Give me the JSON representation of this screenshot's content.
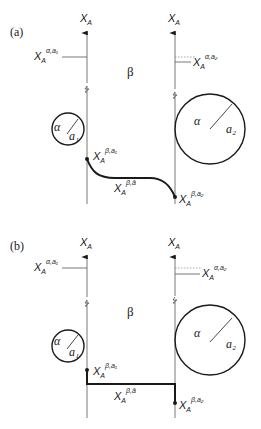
{
  "panels": [
    {
      "id": "a",
      "label": "(a)",
      "left_axis": {
        "label": "X",
        "label_sub": "A",
        "marker": "X",
        "marker_sub": "A",
        "marker_sup": "α,a₁"
      },
      "right_axis": {
        "label": "X",
        "label_sub": "A",
        "marker": "X",
        "marker_sub": "A",
        "marker_sup": "α,a₂"
      },
      "phase_label": "β",
      "small_circle": {
        "phase": "α",
        "radius_label": "a₁"
      },
      "large_circle": {
        "phase": "α",
        "radius_label": "a₂"
      },
      "left_point": {
        "label": "X",
        "sub": "A",
        "sup": "β,a₁"
      },
      "curve_label": {
        "label": "X",
        "sub": "A",
        "sup": "β,ā"
      },
      "right_point": {
        "label": "X",
        "sub": "A",
        "sup": "β,a₂"
      },
      "profile_shape": "smooth curve"
    },
    {
      "id": "b",
      "label": "(b)",
      "left_axis": {
        "label": "X",
        "label_sub": "A",
        "marker": "X",
        "marker_sub": "A",
        "marker_sup": "α,a₁"
      },
      "right_axis": {
        "label": "X",
        "label_sub": "A",
        "marker": "X",
        "marker_sub": "A",
        "marker_sup": "α,a₂"
      },
      "phase_label": "β",
      "small_circle": {
        "phase": "α",
        "radius_label": "a₁"
      },
      "large_circle": {
        "phase": "α",
        "radius_label": "a₂"
      },
      "left_point": {
        "label": "X",
        "sub": "A",
        "sup": "β,a₁"
      },
      "curve_label": {
        "label": "X",
        "sub": "A",
        "sup": "β,ā"
      },
      "right_point": {
        "label": "X",
        "sub": "A",
        "sup": "β,a₂"
      },
      "profile_shape": "step"
    }
  ]
}
